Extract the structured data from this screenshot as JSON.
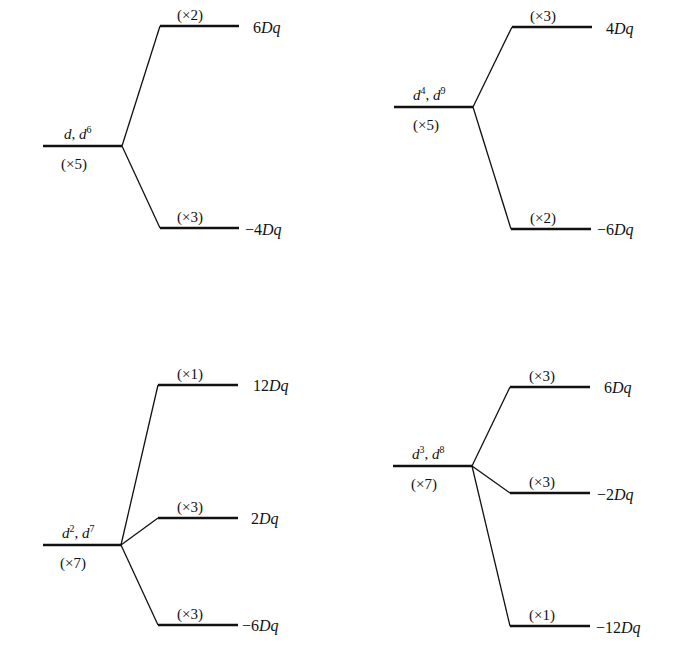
{
  "diagram": {
    "title": "",
    "panels": [
      {
        "id": "d1-d6",
        "ion_label": {
          "base1": "d",
          "sup1": "",
          "sep": ", ",
          "base2": "d",
          "sup2": "6"
        },
        "parent_degeneracy": "(×5)",
        "levels": [
          {
            "degeneracy": "(×2)",
            "energy_num": "6",
            "energy_unit": "Dq",
            "energy_value": 6
          },
          {
            "degeneracy": "(×3)",
            "energy_num": "−4",
            "energy_unit": "Dq",
            "energy_value": -4
          }
        ]
      },
      {
        "id": "d4-d9",
        "ion_label": {
          "base1": "d",
          "sup1": "4",
          "sep": ", ",
          "base2": "d",
          "sup2": "9"
        },
        "parent_degeneracy": "(×5)",
        "levels": [
          {
            "degeneracy": "(×3)",
            "energy_num": "4",
            "energy_unit": "Dq",
            "energy_value": 4
          },
          {
            "degeneracy": "(×2)",
            "energy_num": "−6",
            "energy_unit": "Dq",
            "energy_value": -6
          }
        ]
      },
      {
        "id": "d2-d7",
        "ion_label": {
          "base1": "d",
          "sup1": "2",
          "sep": ", ",
          "base2": "d",
          "sup2": "7"
        },
        "parent_degeneracy": "(×7)",
        "levels": [
          {
            "degeneracy": "(×1)",
            "energy_num": "12",
            "energy_unit": "Dq",
            "energy_value": 12
          },
          {
            "degeneracy": "(×3)",
            "energy_num": "2",
            "energy_unit": "Dq",
            "energy_value": 2
          },
          {
            "degeneracy": "(×3)",
            "energy_num": "−6",
            "energy_unit": "Dq",
            "energy_value": -6
          }
        ]
      },
      {
        "id": "d3-d8",
        "ion_label": {
          "base1": "d",
          "sup1": "3",
          "sep": ", ",
          "base2": "d",
          "sup2": "8"
        },
        "parent_degeneracy": "(×7)",
        "levels": [
          {
            "degeneracy": "(×3)",
            "energy_num": "6",
            "energy_unit": "Dq",
            "energy_value": 6
          },
          {
            "degeneracy": "(×3)",
            "energy_num": "−2",
            "energy_unit": "Dq",
            "energy_value": -2
          },
          {
            "degeneracy": "(×1)",
            "energy_num": "−12",
            "energy_unit": "Dq",
            "energy_value": -12
          }
        ]
      }
    ]
  },
  "colors": {
    "line": "#111111",
    "text": "#111111",
    "background": "#ffffff"
  }
}
